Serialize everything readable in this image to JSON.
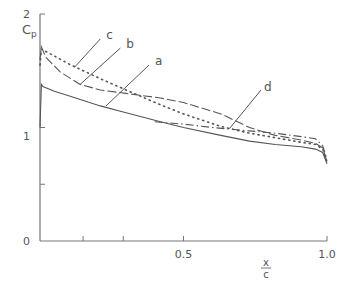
{
  "chart_data": {
    "type": "line",
    "title": "",
    "ylabel": "Cp",
    "xlabel": "x/c",
    "xlim": [
      0,
      1.0
    ],
    "ylim": [
      0,
      2
    ],
    "xticks": [
      {
        "value": 0.15,
        "label": ""
      },
      {
        "value": 0.29,
        "label": ""
      },
      {
        "value": 0.5,
        "label": "0.5"
      },
      {
        "value": 1.0,
        "label": "1.0"
      }
    ],
    "yticks": [
      {
        "value": 0,
        "label": "0"
      },
      {
        "value": 0.5,
        "label": ""
      },
      {
        "value": 1,
        "label": "1"
      },
      {
        "value": 2,
        "label": "2"
      }
    ],
    "grid": false,
    "series": [
      {
        "name": "a",
        "style": "solid",
        "x": [
          0.0,
          0.005,
          0.01,
          0.05,
          0.1,
          0.21,
          0.3,
          0.42,
          0.5,
          0.63,
          0.73,
          0.82,
          0.91,
          0.96,
          0.985,
          1.0
        ],
        "y": [
          1.0,
          1.38,
          1.36,
          1.32,
          1.28,
          1.19,
          1.13,
          1.05,
          1.0,
          0.93,
          0.88,
          0.85,
          0.83,
          0.81,
          0.78,
          0.68
        ]
      },
      {
        "name": "b",
        "style": "dashed",
        "x": [
          0.0,
          0.005,
          0.02,
          0.07,
          0.14,
          0.21,
          0.3,
          0.42,
          0.5,
          0.63,
          0.73,
          0.82,
          0.91,
          0.96,
          0.985,
          1.0
        ],
        "y": [
          1.6,
          1.71,
          1.62,
          1.49,
          1.38,
          1.33,
          1.3,
          1.26,
          1.22,
          1.12,
          1.0,
          0.93,
          0.89,
          0.86,
          0.82,
          0.7
        ]
      },
      {
        "name": "c",
        "style": "dotted",
        "x": [
          0.0,
          0.005,
          0.05,
          0.1,
          0.21,
          0.3,
          0.42,
          0.5,
          0.63,
          0.73,
          0.82,
          0.91,
          0.96,
          0.985,
          1.0
        ],
        "y": [
          1.55,
          1.69,
          1.63,
          1.56,
          1.43,
          1.33,
          1.2,
          1.12,
          1.01,
          0.95,
          0.91,
          0.87,
          0.85,
          0.81,
          0.7
        ]
      },
      {
        "name": "d",
        "style": "dashdot",
        "x": [
          0.4,
          0.5,
          0.6,
          0.73,
          0.82,
          0.91,
          0.96,
          0.985,
          1.0
        ],
        "y": [
          1.05,
          1.03,
          1.0,
          0.97,
          0.95,
          0.92,
          0.9,
          0.84,
          0.72
        ]
      }
    ],
    "annotations": [
      {
        "text": "a",
        "x": 0.39,
        "y": 1.57
      },
      {
        "text": "b",
        "x": 0.29,
        "y": 1.72
      },
      {
        "text": "c",
        "x": 0.22,
        "y": 1.8
      },
      {
        "text": "d",
        "x": 0.77,
        "y": 1.34
      }
    ]
  }
}
